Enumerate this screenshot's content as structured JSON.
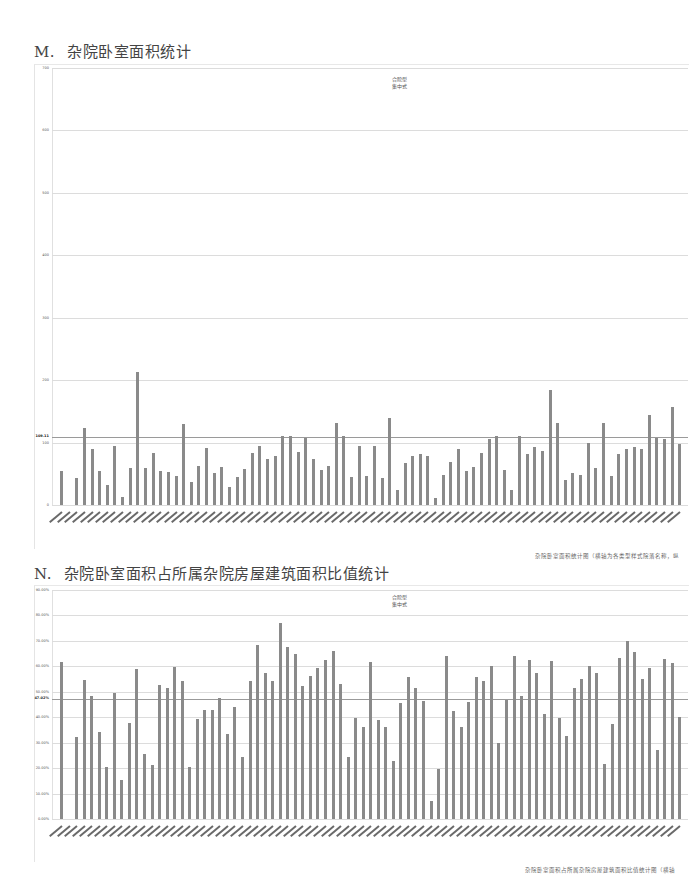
{
  "sections": [
    {
      "letter": "M.",
      "title": "杂院卧室面积统计",
      "caption": "杂院卧室面积统计图（横轴为各类型样式院落名称，纵"
    },
    {
      "letter": "N.",
      "title": "杂院卧室面积占所属杂院房屋建筑面积比值统计",
      "caption": "杂院卧室面积占所属杂院房屋建筑面积比值统计图（横轴"
    }
  ],
  "chart_data": [
    {
      "type": "bar",
      "title": "杂院卧室面积统计",
      "legend": [
        "合院型",
        "集中式"
      ],
      "xlabel": "",
      "ylabel": "",
      "ylim": [
        0,
        700
      ],
      "yticks": [
        "0",
        "100",
        "200",
        "300",
        "400",
        "500",
        "600",
        "700"
      ],
      "grid": true,
      "reference_line": {
        "value": 109.11,
        "label": "109.11"
      },
      "values": [
        55,
        0,
        43,
        124,
        90,
        55,
        32,
        94,
        13,
        60,
        213,
        60,
        84,
        55,
        53,
        47,
        129,
        37,
        63,
        92,
        52,
        61,
        29,
        45,
        58,
        84,
        94,
        74,
        79,
        111,
        110,
        85,
        108,
        74,
        56,
        63,
        131,
        110,
        45,
        95,
        47,
        95,
        43,
        139,
        24,
        68,
        79,
        82,
        79,
        11,
        48,
        69,
        89,
        55,
        61,
        84,
        106,
        111,
        56,
        24,
        111,
        81,
        93,
        86,
        184,
        132,
        40,
        52,
        48,
        100,
        60,
        131,
        47,
        82,
        90,
        93,
        90,
        144,
        108,
        106,
        157,
        97
      ]
    },
    {
      "type": "bar",
      "title": "杂院卧室面积占所属杂院房屋建筑面积比值统计",
      "legend": [
        "合院型",
        "集中式"
      ],
      "xlabel": "",
      "ylabel": "",
      "ylim": [
        0,
        90
      ],
      "yticks": [
        "0.00%",
        "10.00%",
        "20.00%",
        "30.00%",
        "40.00%",
        "50.00%",
        "60.00%",
        "70.00%",
        "80.00%",
        "90.00%"
      ],
      "grid": true,
      "reference_line": {
        "value": 47.02,
        "label": "47.02%"
      },
      "values": [
        61.8,
        0,
        32.1,
        54.6,
        48.3,
        34.1,
        20.4,
        49.6,
        15.3,
        37.8,
        58.9,
        25.5,
        21.3,
        52.8,
        51.5,
        59.8,
        54.1,
        20.6,
        39.2,
        42.9,
        42.7,
        47.5,
        33.4,
        44.0,
        24.2,
        54.1,
        68.4,
        57.2,
        54.2,
        76.9,
        67.7,
        64.7,
        52.4,
        56.2,
        59.3,
        62.6,
        66.1,
        53.2,
        24.5,
        39.8,
        36.1,
        61.6,
        38.8,
        36.3,
        22.7,
        45.7,
        55.7,
        51.6,
        46.2,
        7.1,
        19.8,
        64.2,
        42.3,
        36.3,
        45.9,
        55.8,
        54.2,
        60.2,
        30.0,
        46.8,
        64.2,
        48.4,
        62.3,
        57.2,
        41.3,
        62.2,
        39.6,
        32.7,
        51.4,
        54.9,
        60.2,
        57.2,
        21.6,
        37.2,
        63.1,
        69.8,
        65.6,
        54.9,
        59.5,
        27.0,
        63.0,
        61.2,
        40.2
      ]
    }
  ]
}
